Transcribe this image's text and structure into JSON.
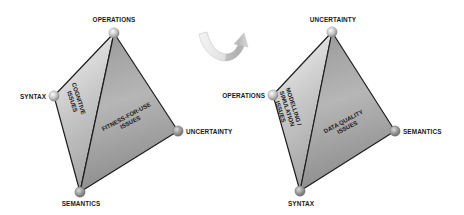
{
  "diagram": {
    "left": {
      "vertices": {
        "top": "OPERATIONS",
        "left": "SYNTAX",
        "right": "UNCERTAINTY",
        "bottom": "SEMANTICS"
      },
      "faces": {
        "left_face": [
          "COGNITIVE",
          "ISSUES"
        ],
        "right_face": [
          "FITNESS-FOR-USE",
          "ISSUES"
        ]
      }
    },
    "transition": {
      "icon": "rotate-arrow-icon"
    },
    "right": {
      "vertices": {
        "top": "UNCERTAINTY",
        "left": "OPERATIONS",
        "right": "SEMANTICS",
        "bottom": "SYNTAX"
      },
      "faces": {
        "left_face": [
          "MODELLING /",
          "SIMULATION",
          "ISSUES"
        ],
        "right_face": [
          "DATA QUALITY",
          "ISSUES"
        ]
      }
    },
    "colors": {
      "edge": "#1e1e1e",
      "face_light_top": "#f4f4f4",
      "face_light_bottom": "#a8a8a8",
      "face_dark_top": "#b4b4b4",
      "face_dark_bottom": "#8a8a8a",
      "sphere_light": "#f2f2f2",
      "sphere_dark": "#8c8c8c"
    }
  }
}
